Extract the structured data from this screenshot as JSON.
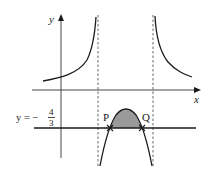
{
  "diagram": {
    "axes": {
      "x_label": "x",
      "y_label": "y"
    },
    "line_label": {
      "prefix": "y = −",
      "numerator": "4",
      "denominator": "3"
    },
    "points": [
      {
        "name": "P"
      },
      {
        "name": "Q"
      }
    ],
    "colors": {
      "curve": "#1a1a1a",
      "axis": "#333333",
      "shade": "#9a9a9a",
      "asymptote": "#555555"
    }
  }
}
